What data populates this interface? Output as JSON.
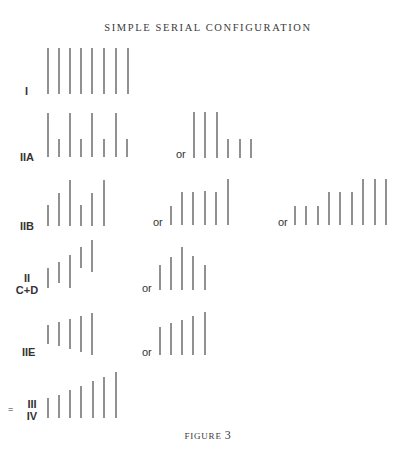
{
  "title": "SIMPLE SERIAL CONFIGURATION",
  "caption": {
    "prefix": "FIGURE",
    "number": "3"
  },
  "or_label": "or",
  "rows": [
    {
      "id": "I",
      "label": "I",
      "variants": [
        {
          "lines": [
            [
              48,
              48,
              94
            ],
            [
              59,
              48,
              94
            ],
            [
              70,
              48,
              94
            ],
            [
              81,
              48,
              94
            ],
            [
              92,
              48,
              94
            ],
            [
              104,
              48,
              94
            ],
            [
              116,
              48,
              94
            ],
            [
              128,
              48,
              94
            ]
          ]
        }
      ]
    },
    {
      "id": "IIA",
      "label": "IIA",
      "variants": [
        {
          "lines": [
            [
              48,
              113,
              157
            ],
            [
              59,
              139,
              157
            ],
            [
              70,
              113,
              157
            ],
            [
              81,
              139,
              157
            ],
            [
              92,
              113,
              157
            ],
            [
              104,
              139,
              157
            ],
            [
              116,
              113,
              157
            ],
            [
              127,
              139,
              157
            ]
          ]
        },
        {
          "lines": [
            [
              194,
              112,
              158
            ],
            [
              205,
              112,
              158
            ],
            [
              217,
              112,
              158
            ],
            [
              228,
              139,
              158
            ],
            [
              240,
              139,
              158
            ],
            [
              251,
              139,
              158
            ]
          ]
        }
      ]
    },
    {
      "id": "IIB",
      "label": "IIB",
      "variants": [
        {
          "lines": [
            [
              48,
              205,
              226
            ],
            [
              59,
              193,
              226
            ],
            [
              70,
              180,
              226
            ],
            [
              81,
              205,
              226
            ],
            [
              92,
              193,
              226
            ],
            [
              104,
              180,
              226
            ]
          ]
        },
        {
          "lines": [
            [
              171,
              206,
              225
            ],
            [
              182,
              192,
              225
            ],
            [
              193,
              192,
              225
            ],
            [
              205,
              191,
              225
            ],
            [
              216,
              192,
              225
            ],
            [
              228,
              179,
              225
            ]
          ]
        },
        {
          "lines": [
            [
              295,
              206,
              225
            ],
            [
              306,
              206,
              225
            ],
            [
              318,
              206,
              225
            ],
            [
              329,
              192,
              225
            ],
            [
              340,
              192,
              225
            ],
            [
              352,
              192,
              225
            ],
            [
              363,
              179,
              225
            ],
            [
              375,
              179,
              225
            ],
            [
              386,
              179,
              225
            ]
          ]
        }
      ]
    },
    {
      "id": "IICD",
      "label_line1": "II",
      "label_line2": "C+D",
      "variants": [
        {
          "lines": [
            [
              48,
              268,
              288
            ],
            [
              59,
              262,
              283
            ],
            [
              70,
              255,
              288
            ],
            [
              81,
              247,
              268
            ],
            [
              92,
              240,
              272
            ]
          ]
        },
        {
          "lines": [
            [
              160,
              265,
              290
            ],
            [
              171,
              257,
              290
            ],
            [
              182,
              247,
              290
            ],
            [
              193,
              256,
              290
            ],
            [
              205,
              265,
              290
            ]
          ]
        }
      ]
    },
    {
      "id": "IIE",
      "label": "IIE",
      "variants": [
        {
          "lines": [
            [
              48,
              325,
              344
            ],
            [
              59,
              322,
              346
            ],
            [
              70,
              319,
              349
            ],
            [
              81,
              316,
              352
            ],
            [
              92,
              313,
              355
            ]
          ]
        },
        {
          "lines": [
            [
              160,
              327,
              355
            ],
            [
              171,
              323,
              355
            ],
            [
              182,
              320,
              355
            ],
            [
              193,
              316,
              355
            ],
            [
              205,
              312,
              355
            ]
          ]
        }
      ]
    },
    {
      "id": "III-IV",
      "prefix": "=",
      "label_line1": "III",
      "label_line2": "IV",
      "variants": [
        {
          "lines": [
            [
              48,
              398,
              418
            ],
            [
              59,
              395,
              418
            ],
            [
              70,
              390,
              418
            ],
            [
              81,
              386,
              418
            ],
            [
              93,
              381,
              418
            ],
            [
              104,
              377,
              418
            ],
            [
              116,
              372,
              418
            ]
          ]
        }
      ]
    }
  ]
}
